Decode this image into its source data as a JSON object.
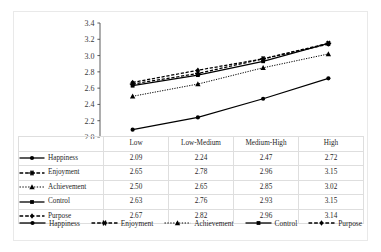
{
  "chart_data": {
    "type": "line",
    "title": "",
    "xlabel": "",
    "ylabel": "",
    "categories": [
      "Low",
      "Low-Medium",
      "Medium-High",
      "High"
    ],
    "ylim": [
      2.0,
      3.4
    ],
    "ytick_labels": [
      "2.0",
      "2.2",
      "2.4",
      "2.6",
      "2.8",
      "3.0",
      "3.2",
      "3.4"
    ],
    "ytick_values": [
      2.0,
      2.2,
      2.4,
      2.6,
      2.8,
      3.0,
      3.2,
      3.4
    ],
    "grid": false,
    "legend_position": "bottom",
    "series": [
      {
        "name": "Happiness",
        "values": [
          2.09,
          2.24,
          2.47,
          2.72
        ],
        "labels": [
          "2.09",
          "2.24",
          "2.47",
          "2.72"
        ],
        "line_style": "solid",
        "marker": "circle",
        "color": "#000000"
      },
      {
        "name": "Enjoyment",
        "values": [
          2.65,
          2.78,
          2.96,
          3.15
        ],
        "labels": [
          "2.65",
          "2.78",
          "2.96",
          "3.15"
        ],
        "line_style": "dashed",
        "marker": "asterisk",
        "color": "#000000"
      },
      {
        "name": "Achievement",
        "values": [
          2.5,
          2.65,
          2.85,
          3.02
        ],
        "labels": [
          "2.50",
          "2.65",
          "2.85",
          "3.02"
        ],
        "line_style": "dotted",
        "marker": "triangle",
        "color": "#000000"
      },
      {
        "name": "Control",
        "values": [
          2.63,
          2.76,
          2.93,
          3.15
        ],
        "labels": [
          "2.63",
          "2.76",
          "2.93",
          "3.15"
        ],
        "line_style": "solid",
        "marker": "square",
        "color": "#000000"
      },
      {
        "name": "Purpose",
        "values": [
          2.67,
          2.82,
          2.96,
          3.14
        ],
        "labels": [
          "2.67",
          "2.82",
          "2.96",
          "3.14"
        ],
        "line_style": "dashed",
        "marker": "diamond",
        "color": "#000000"
      }
    ]
  },
  "table": {
    "corner_label": "",
    "column_headers": [
      "Low",
      "Low-Medium",
      "Medium-High",
      "High"
    ],
    "rows": [
      {
        "label": "Happiness",
        "cells": [
          "2.09",
          "2.24",
          "2.47",
          "2.72"
        ]
      },
      {
        "label": "Enjoyment",
        "cells": [
          "2.65",
          "2.78",
          "2.96",
          "3.15"
        ]
      },
      {
        "label": "Achievement",
        "cells": [
          "2.50",
          "2.65",
          "2.85",
          "3.02"
        ]
      },
      {
        "label": "Control",
        "cells": [
          "2.63",
          "2.76",
          "2.93",
          "3.15"
        ]
      },
      {
        "label": "Purpose",
        "cells": [
          "2.67",
          "2.82",
          "2.96",
          "3.14"
        ]
      }
    ]
  },
  "legend": {
    "entries": [
      "Happiness",
      "Enjoyment",
      "Achievement",
      "Control",
      "Purpose"
    ]
  },
  "colors": {
    "ink": "#000000",
    "grid_border": "#dedede",
    "frame": "#e9e9e9",
    "background": "#ffffff"
  }
}
